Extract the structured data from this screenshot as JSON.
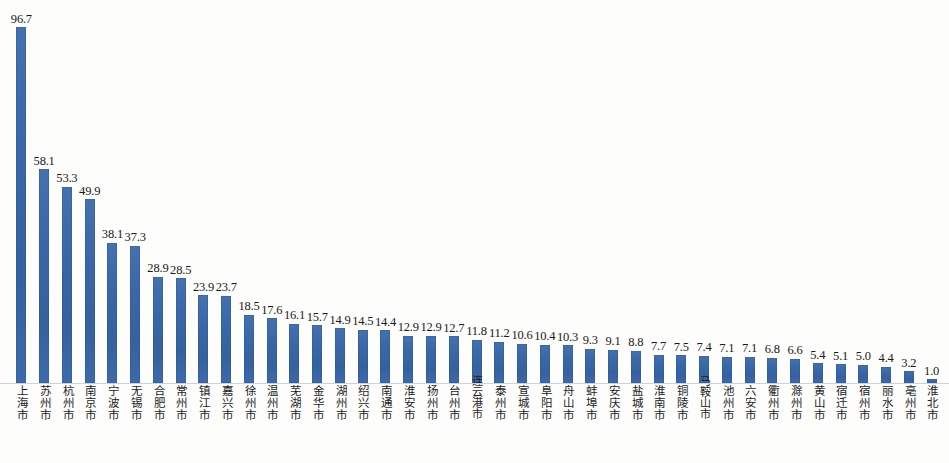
{
  "chart": {
    "title": "",
    "subtitle": "",
    "bar_color": "#3a68a8",
    "baseline_color": "#c8d4e4",
    "background": "#fdfdfc"
  },
  "chart_data": {
    "type": "bar",
    "title": "",
    "xlabel": "",
    "ylabel": "",
    "ylim": [
      0,
      96.7
    ],
    "grid": false,
    "legend": "none",
    "orientation": "vertical",
    "value_labels": true,
    "categories": [
      "上海市",
      "苏州市",
      "杭州市",
      "南京市",
      "宁波市",
      "无锡市",
      "合肥市",
      "常州市",
      "镇江市",
      "嘉兴市",
      "徐州市",
      "温州市",
      "芜湖市",
      "金华市",
      "湖州市",
      "绍兴市",
      "南通市",
      "淮安市",
      "扬州市",
      "台州市",
      "连云港市",
      "泰州市",
      "宣城市",
      "阜阳市",
      "舟山市",
      "蚌埠市",
      "安庆市",
      "盐城市",
      "淮南市",
      "铜陵市",
      "马鞍山市",
      "池州市",
      "六安市",
      "衢州市",
      "滁州市",
      "黄山市",
      "宿迁市",
      "宿州市",
      "丽水市",
      "亳州市",
      "淮北市"
    ],
    "values": [
      96.7,
      58.1,
      53.3,
      49.9,
      38.1,
      37.3,
      28.9,
      28.5,
      23.9,
      23.7,
      18.5,
      17.6,
      16.1,
      15.7,
      14.9,
      14.5,
      14.4,
      12.9,
      12.9,
      12.7,
      11.8,
      11.2,
      10.6,
      10.4,
      10.3,
      9.3,
      9.1,
      8.8,
      7.7,
      7.5,
      7.4,
      7.1,
      7.1,
      6.8,
      6.6,
      5.4,
      5.1,
      5.0,
      4.4,
      3.2,
      1.0
    ],
    "value_label_texts": [
      "96.7",
      "58.1",
      "53.3",
      "49.9",
      "38.1",
      "37.3",
      "28.9",
      "28.5",
      "23.9",
      "23.7",
      "18.5",
      "17.6",
      "16.1",
      "15.7",
      "14.9",
      "14.5",
      "14.4",
      "12.9",
      "12.9",
      "12.7",
      "11.8",
      "11.2",
      "10.6",
      "10.4",
      "10.3",
      "9.3",
      "9.1",
      "8.8",
      "7.7",
      "7.5",
      "7.4",
      "7.1",
      "7.1",
      "6.8",
      "6.6",
      "5.4",
      "5.1",
      "5.0",
      "4.4",
      "3.2",
      "1.0"
    ]
  }
}
